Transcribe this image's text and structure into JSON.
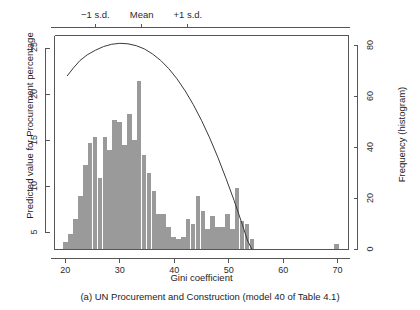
{
  "chart_data": {
    "type": "bar",
    "title": "",
    "caption": "(a) UN Procurement and Construction (model 40 of Table 4.1)",
    "xlabel": "Gini coefficient",
    "ylabel_left": "Predicted value for Procurement percentage",
    "ylabel_right": "Frequency (histogram)",
    "xlim": [
      18,
      72
    ],
    "xticks": [
      20,
      30,
      40,
      50,
      60,
      70
    ],
    "xtick_labels": [
      "20",
      "30",
      "40",
      "50",
      "60",
      "70"
    ],
    "ylim_left": [
      3.2,
      26.4
    ],
    "yticks_left": [
      5,
      10,
      15,
      20,
      25
    ],
    "ytick_labels_left": [
      "5",
      "10",
      "15",
      "20",
      "25"
    ],
    "ylim_right": [
      0,
      84
    ],
    "yticks_right": [
      0,
      20,
      40,
      60,
      80
    ],
    "ytick_labels_right": [
      "0",
      "20",
      "40",
      "60",
      "80"
    ],
    "grid": false,
    "legend": "none",
    "top_axis": {
      "ticks": [
        25.5,
        34.0,
        42.5
      ],
      "labels": [
        "−1 s.d.",
        "Mean",
        "+1 s.d."
      ]
    },
    "histogram": {
      "name": "Frequency (histogram)",
      "color": "#9a9a9a",
      "bin_width": 0.95,
      "bins": [
        {
          "x": 20.1,
          "freq": 3
        },
        {
          "x": 21.0,
          "freq": 6
        },
        {
          "x": 21.9,
          "freq": 12
        },
        {
          "x": 22.8,
          "freq": 21
        },
        {
          "x": 23.7,
          "freq": 33
        },
        {
          "x": 24.6,
          "freq": 42
        },
        {
          "x": 25.5,
          "freq": 44
        },
        {
          "x": 26.4,
          "freq": 28
        },
        {
          "x": 27.3,
          "freq": 44
        },
        {
          "x": 28.2,
          "freq": 39
        },
        {
          "x": 29.1,
          "freq": 51
        },
        {
          "x": 30.0,
          "freq": 50
        },
        {
          "x": 30.9,
          "freq": 41
        },
        {
          "x": 31.8,
          "freq": 53
        },
        {
          "x": 32.7,
          "freq": 43
        },
        {
          "x": 33.6,
          "freq": 66
        },
        {
          "x": 34.5,
          "freq": 37
        },
        {
          "x": 35.4,
          "freq": 30
        },
        {
          "x": 36.3,
          "freq": 23
        },
        {
          "x": 37.2,
          "freq": 14
        },
        {
          "x": 38.1,
          "freq": 14
        },
        {
          "x": 39.0,
          "freq": 9
        },
        {
          "x": 39.9,
          "freq": 5
        },
        {
          "x": 40.8,
          "freq": 4
        },
        {
          "x": 41.7,
          "freq": 5
        },
        {
          "x": 42.6,
          "freq": 12
        },
        {
          "x": 43.5,
          "freq": 10
        },
        {
          "x": 44.4,
          "freq": 21
        },
        {
          "x": 45.3,
          "freq": 15
        },
        {
          "x": 46.2,
          "freq": 8
        },
        {
          "x": 47.1,
          "freq": 13
        },
        {
          "x": 48.0,
          "freq": 9
        },
        {
          "x": 48.9,
          "freq": 9
        },
        {
          "x": 49.8,
          "freq": 14
        },
        {
          "x": 50.7,
          "freq": 8
        },
        {
          "x": 51.6,
          "freq": 24
        },
        {
          "x": 52.5,
          "freq": 11
        },
        {
          "x": 53.4,
          "freq": 10
        },
        {
          "x": 54.3,
          "freq": 4
        },
        {
          "x": 69.8,
          "freq": 2
        }
      ]
    },
    "curve": {
      "name": "Predicted value for Procurement percentage",
      "color": "#3a3a3a",
      "points": [
        {
          "x": 20.3,
          "y": 22.0
        },
        {
          "x": 21.5,
          "y": 22.9
        },
        {
          "x": 22.7,
          "y": 23.7
        },
        {
          "x": 24.0,
          "y": 24.3
        },
        {
          "x": 25.5,
          "y": 24.8
        },
        {
          "x": 27.0,
          "y": 25.2
        },
        {
          "x": 28.5,
          "y": 25.45
        },
        {
          "x": 30.0,
          "y": 25.55
        },
        {
          "x": 31.5,
          "y": 25.5
        },
        {
          "x": 33.0,
          "y": 25.3
        },
        {
          "x": 34.5,
          "y": 24.95
        },
        {
          "x": 36.0,
          "y": 24.4
        },
        {
          "x": 37.5,
          "y": 23.7
        },
        {
          "x": 39.0,
          "y": 22.8
        },
        {
          "x": 40.5,
          "y": 21.7
        },
        {
          "x": 42.0,
          "y": 20.4
        },
        {
          "x": 43.5,
          "y": 18.9
        },
        {
          "x": 45.0,
          "y": 17.2
        },
        {
          "x": 46.5,
          "y": 15.3
        },
        {
          "x": 48.0,
          "y": 13.2
        },
        {
          "x": 49.5,
          "y": 10.9
        },
        {
          "x": 51.0,
          "y": 8.5
        },
        {
          "x": 52.5,
          "y": 5.9
        },
        {
          "x": 53.5,
          "y": 4.1
        },
        {
          "x": 54.3,
          "y": 3.2
        }
      ]
    }
  }
}
